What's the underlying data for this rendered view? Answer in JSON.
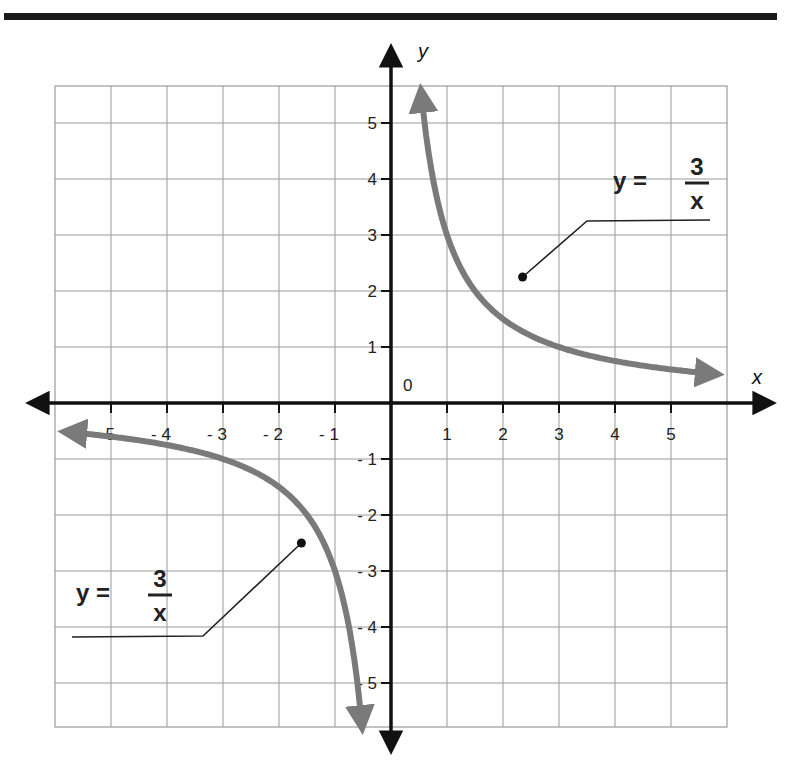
{
  "chart_data": {
    "type": "line",
    "title": "",
    "function": "y = 3/x",
    "xlabel": "x",
    "ylabel": "y",
    "origin_label": "0",
    "xlim": [
      -6,
      6
    ],
    "ylim": [
      -6,
      6
    ],
    "grid": true,
    "x_ticks": [
      -5,
      -4,
      -3,
      -2,
      -1,
      1,
      2,
      3,
      4,
      5
    ],
    "x_tick_labels": [
      "- 5",
      "- 4",
      "- 3",
      "- 2",
      "- 1",
      "1",
      "2",
      "3",
      "4",
      "5"
    ],
    "y_ticks": [
      5,
      4,
      3,
      2,
      1,
      -1,
      -2,
      -3,
      -4,
      -5
    ],
    "y_tick_labels": [
      "5",
      "4",
      "3",
      "2",
      "1",
      "- 1",
      "- 2",
      "- 3",
      "- 4",
      "- 5"
    ],
    "series": [
      {
        "name": "y = 3/x (quadrant I branch)",
        "x_range": [
          0.54,
          5.8
        ],
        "points": [
          [
            0.54,
            5.56
          ],
          [
            0.75,
            4.0
          ],
          [
            1,
            3
          ],
          [
            1.5,
            2
          ],
          [
            2,
            1.5
          ],
          [
            3,
            1
          ],
          [
            4,
            0.75
          ],
          [
            5,
            0.6
          ],
          [
            5.8,
            0.52
          ]
        ],
        "color": "#7a7a7a"
      },
      {
        "name": "y = 3/x (quadrant III branch)",
        "x_range": [
          -5.8,
          -0.52
        ],
        "points": [
          [
            -5.8,
            -0.52
          ],
          [
            -5,
            -0.6
          ],
          [
            -4,
            -0.75
          ],
          [
            -3,
            -1
          ],
          [
            -2,
            -1.5
          ],
          [
            -1.5,
            -2
          ],
          [
            -1,
            -3
          ],
          [
            -0.75,
            -4
          ],
          [
            -0.54,
            -5.56
          ]
        ],
        "color": "#7a7a7a"
      }
    ],
    "annotations": [
      {
        "text_lhs": "y =",
        "numerator": "3",
        "denominator": "x",
        "position": "upper-right",
        "points_to": [
          2.35,
          2.25
        ]
      },
      {
        "text_lhs": "y =",
        "numerator": "3",
        "denominator": "x",
        "position": "lower-left",
        "points_to": [
          -1.6,
          -2.5
        ]
      }
    ],
    "colors": {
      "curve": "#7a7a7a",
      "axes": "#111111",
      "grid": "#9a9a9a",
      "rule": "#1a1a1a"
    }
  }
}
